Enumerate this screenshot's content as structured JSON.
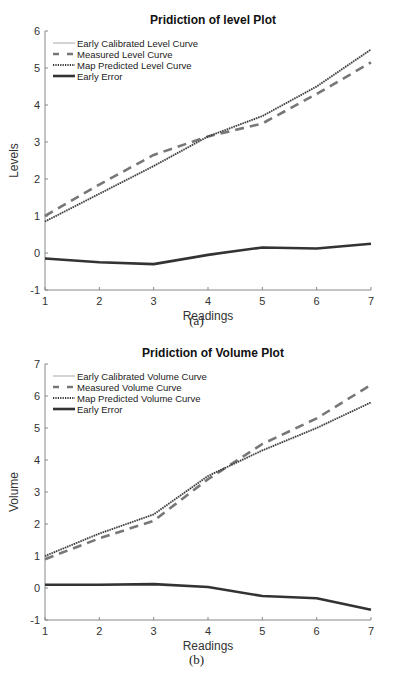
{
  "chart_data": [
    {
      "type": "line",
      "title": "Pridiction of level Plot",
      "xlabel": "Readings",
      "ylabel": "Levels",
      "caption": "(a)",
      "x": [
        1,
        2,
        3,
        4,
        5,
        6,
        7
      ],
      "xlim": [
        1,
        7
      ],
      "ylim": [
        -1,
        6
      ],
      "xticks": [
        "1",
        "2",
        "3",
        "4",
        "5",
        "6",
        "7"
      ],
      "yticks": [
        "-1",
        "0",
        "1",
        "2",
        "3",
        "4",
        "5",
        "6"
      ],
      "grid": false,
      "legend_position": "upper left",
      "series": [
        {
          "name": "Early Calibrated Level Curve",
          "style": "solid",
          "color": "#c8c8c8",
          "values": [
            0.85,
            1.6,
            2.35,
            3.15,
            3.7,
            4.5,
            5.5
          ]
        },
        {
          "name": "Measured Level Curve",
          "style": "dashed",
          "color": "#777777",
          "values": [
            1.0,
            1.85,
            2.65,
            3.15,
            3.5,
            4.3,
            5.15
          ]
        },
        {
          "name": "Map Predicted Level Curve",
          "style": "dotted",
          "color": "#333333",
          "values": [
            0.85,
            1.6,
            2.35,
            3.15,
            3.7,
            4.5,
            5.5
          ]
        },
        {
          "name": "Early Error",
          "style": "solid-thick",
          "color": "#333333",
          "values": [
            -0.15,
            -0.25,
            -0.3,
            -0.05,
            0.15,
            0.12,
            0.25
          ]
        }
      ]
    },
    {
      "type": "line",
      "title": "Pridiction of Volume Plot",
      "xlabel": "Readings",
      "ylabel": "Volume",
      "caption": "(b)",
      "x": [
        1,
        2,
        3,
        4,
        5,
        6,
        7
      ],
      "xlim": [
        1,
        7
      ],
      "ylim": [
        -1,
        7
      ],
      "xticks": [
        "1",
        "2",
        "3",
        "4",
        "5",
        "6",
        "7"
      ],
      "yticks": [
        "-1",
        "0",
        "1",
        "2",
        "3",
        "4",
        "5",
        "6",
        "7"
      ],
      "grid": false,
      "legend_position": "upper left",
      "series": [
        {
          "name": "Early Calibrated Volume Curve",
          "style": "solid",
          "color": "#c8c8c8",
          "values": [
            1.0,
            1.7,
            2.3,
            3.5,
            4.3,
            5.0,
            5.8
          ]
        },
        {
          "name": "Measured Volume Curve",
          "style": "dashed",
          "color": "#777777",
          "values": [
            0.9,
            1.55,
            2.1,
            3.4,
            4.5,
            5.3,
            6.35
          ]
        },
        {
          "name": "Map Predicted Volume Curve",
          "style": "dotted",
          "color": "#333333",
          "values": [
            1.0,
            1.7,
            2.3,
            3.5,
            4.3,
            5.0,
            5.8
          ]
        },
        {
          "name": "Early Error",
          "style": "solid-thick",
          "color": "#333333",
          "values": [
            0.1,
            0.1,
            0.12,
            0.03,
            -0.25,
            -0.32,
            -0.68
          ]
        }
      ]
    }
  ]
}
